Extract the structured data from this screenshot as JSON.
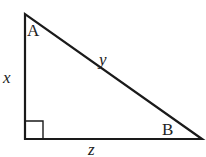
{
  "diagram": {
    "type": "right-triangle",
    "vertices": {
      "A": {
        "label": "A",
        "angle": "acute, top"
      },
      "B": {
        "label": "B",
        "angle": "acute, bottom-right"
      },
      "C": {
        "label": "",
        "angle": "right angle, bottom-left"
      }
    },
    "sides": {
      "x": {
        "label": "x",
        "position": "left vertical leg"
      },
      "y": {
        "label": "y",
        "position": "hypotenuse"
      },
      "z": {
        "label": "z",
        "position": "bottom horizontal leg"
      }
    },
    "colors": {
      "stroke": "#1a1a1a",
      "background": "#ffffff"
    }
  }
}
